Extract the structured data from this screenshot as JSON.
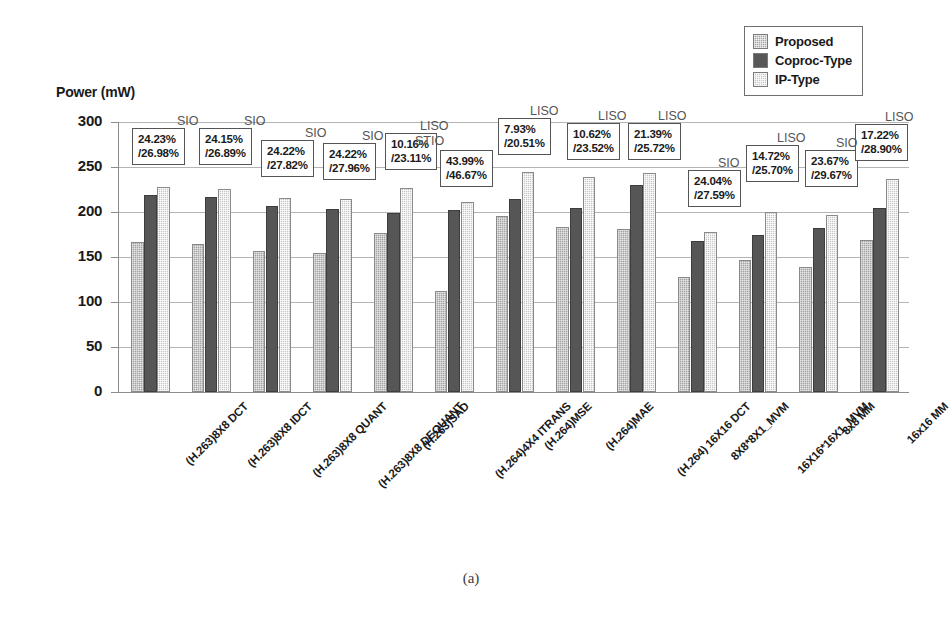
{
  "figure": {
    "caption": "(a)",
    "axis_title": "Power (mW)"
  },
  "legend": {
    "position": "top-right",
    "items": [
      {
        "label": "Proposed",
        "icon": "legend-swatch-proposed",
        "color": "#a6a6a6"
      },
      {
        "label": "Coproc-Type",
        "icon": "legend-swatch-coproc",
        "color": "#585858"
      },
      {
        "label": "IP-Type",
        "icon": "legend-swatch-ip",
        "color": "#c8c8c8"
      }
    ]
  },
  "chart_data": {
    "type": "bar",
    "title": "",
    "xlabel": "",
    "ylabel": "Power (mW)",
    "ylim": [
      0,
      300
    ],
    "yticks": [
      0,
      50,
      100,
      150,
      200,
      250,
      300
    ],
    "grid": true,
    "categories": [
      "(H.263)8X8 DCT",
      "(H.263)8X8 IDCT",
      "(H.263)8X8 QUANT",
      "(H.263)8X8 DEQUANT",
      "(H.263)SAD",
      "(H.264)4X4 ITRANS",
      "(H.264)MSE",
      "(H.264)MAE",
      "(H.264) 16X16 DCT",
      "8X8*8X1_MVM",
      "16X16*16X1_MVM",
      "8x8 MM",
      "16x16 MM"
    ],
    "series": [
      {
        "name": "Proposed",
        "values": [
          167,
          165,
          157,
          155,
          177,
          112,
          196,
          183,
          181,
          128,
          147,
          139,
          169
        ]
      },
      {
        "name": "Coproc-Type",
        "values": [
          219,
          217,
          207,
          203,
          199,
          202,
          214,
          205,
          230,
          168,
          174,
          182,
          204
        ]
      },
      {
        "name": "IP-Type",
        "values": [
          228,
          226,
          216,
          215,
          227,
          211,
          245,
          239,
          243,
          178,
          200,
          197,
          237
        ]
      }
    ],
    "annotations": [
      {
        "tag": "SIO",
        "line1": "24.23%",
        "line2": "/26.98%"
      },
      {
        "tag": "SIO",
        "line1": "24.15%",
        "line2": "/26.89%"
      },
      {
        "tag": "SIO",
        "line1": "24.22%",
        "line2": "/27.82%"
      },
      {
        "tag": "SIO",
        "line1": "24.22%",
        "line2": "/27.96%"
      },
      {
        "tag": "LISO",
        "line1": "10.16%",
        "line2": "/23.11%"
      },
      {
        "tag": "STIO",
        "line1": "43.99%",
        "line2": "/46.67%"
      },
      {
        "tag": "LISO",
        "line1": "7.93%",
        "line2": "/20.51%"
      },
      {
        "tag": "LISO",
        "line1": "10.62%",
        "line2": "/23.52%"
      },
      {
        "tag": "LISO",
        "line1": "21.39%",
        "line2": "/25.72%"
      },
      {
        "tag": "SIO",
        "line1": "24.04%",
        "line2": "/27.59%"
      },
      {
        "tag": "LISO",
        "line1": "14.72%",
        "line2": "/25.70%"
      },
      {
        "tag": "SIO",
        "line1": "23.67%",
        "line2": "/29.67%"
      },
      {
        "tag": "LISO",
        "line1": "17.22%",
        "line2": "/28.90%"
      }
    ]
  }
}
